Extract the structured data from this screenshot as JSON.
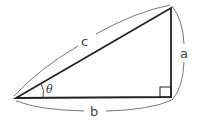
{
  "diagram": {
    "type": "right-triangle",
    "labels": {
      "hypotenuse": "c",
      "opposite": "a",
      "adjacent": "b",
      "angle": "θ"
    },
    "colors": {
      "triangle_stroke": "#222222",
      "brace_stroke": "#555555",
      "label": "#444444"
    }
  }
}
